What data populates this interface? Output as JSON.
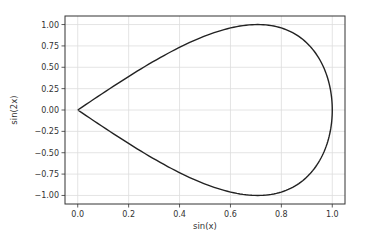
{
  "chart_data": {
    "type": "line",
    "title": "",
    "xlabel": "sin(x)",
    "ylabel": "sin(2x)",
    "xlim": [
      -0.05,
      1.05
    ],
    "ylim": [
      -1.1,
      1.1
    ],
    "grid": true,
    "legend": null,
    "xticks": [
      0.0,
      0.2,
      0.4,
      0.6,
      0.8,
      1.0
    ],
    "xtick_labels": [
      "0.0",
      "0.2",
      "0.4",
      "0.6",
      "0.8",
      "1.0"
    ],
    "yticks": [
      1.0,
      0.75,
      0.5,
      0.25,
      0.0,
      -0.25,
      -0.5,
      -0.75,
      -1.0
    ],
    "ytick_labels": [
      "1.00",
      "0.75",
      "0.50",
      "0.25",
      "0.00",
      "−0.25",
      "−0.50",
      "−0.75",
      "−1.00"
    ],
    "series": [
      {
        "name": "sin(2x) vs sin(x)",
        "color": "#222222",
        "parametric": "x = sin(t), y = sin(2t), t in [0, pi]",
        "x": [
          0.0,
          0.156,
          0.309,
          0.454,
          0.588,
          0.707,
          0.809,
          0.891,
          0.951,
          0.988,
          1.0,
          0.988,
          0.951,
          0.891,
          0.809,
          0.707,
          0.588,
          0.454,
          0.309,
          0.156,
          0.0
        ],
        "y": [
          0.0,
          0.309,
          0.588,
          0.809,
          0.951,
          1.0,
          0.951,
          0.809,
          0.588,
          0.309,
          0.0,
          -0.309,
          -0.588,
          -0.809,
          -0.951,
          -1.0,
          -0.951,
          -0.809,
          -0.588,
          -0.309,
          0.0
        ]
      }
    ]
  },
  "colors": {
    "background": "#ffffff",
    "axes_frame": "#333333",
    "grid": "#dddddd",
    "line": "#222222",
    "text": "#333333"
  }
}
